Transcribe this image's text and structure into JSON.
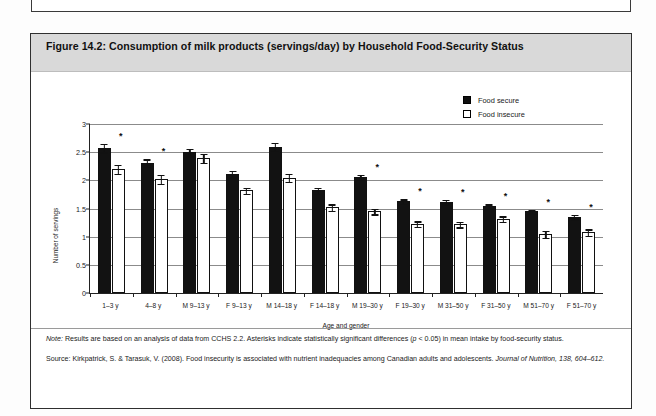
{
  "figure": {
    "title": "Figure 14.2: Consumption of milk products (servings/day) by Household Food-Security Status"
  },
  "legend": {
    "items": [
      {
        "label": "Food secure",
        "swatch": "filled-square-icon",
        "color": "#121212"
      },
      {
        "label": "Food insecure",
        "swatch": "open-square-icon",
        "color": "#ffffff"
      }
    ]
  },
  "notes": {
    "note_label": "Note:",
    "note_text": " Results are based on an analysis of data from CCHS 2.2. Asterisks indicate statistically significant differences (",
    "note_p_italic": "p",
    "note_text_2": " < 0.05) in mean intake by food-security status.",
    "source_label": "Source:",
    "source_text": " Kirkpatrick, S. & Tarasuk, V. (2008). Food insecurity is associated with nutrient inadequacies among Canadian adults and adolescents. ",
    "source_journal": "Journal of Nutrition, 138",
    "source_pages": ", 604–612."
  },
  "chart_data": {
    "type": "bar",
    "title": "Figure 14.2: Consumption of milk products (servings/day) by Household Food-Security Status",
    "xlabel": "Age and gender",
    "ylabel": "Number of servings",
    "ylim": [
      0,
      3
    ],
    "yticks": [
      0,
      0.5,
      1,
      1.5,
      2,
      2.5,
      3
    ],
    "ytick_labels": [
      "0",
      "0.5",
      "1",
      "1.5",
      "2",
      "2.5",
      "3"
    ],
    "grid": true,
    "legend_position": "top-right",
    "categories": [
      "1–3 y",
      "4–8 y",
      "M 9–13 y",
      "F 9–13 y",
      "M 14–18 y",
      "F 14–18 y",
      "M 19–30 y",
      "F 19–30 y",
      "M 31–50 y",
      "F 31–50 y",
      "M 51–70 y",
      "F 51–70 y"
    ],
    "series": [
      {
        "name": "Food secure",
        "color": "#121212",
        "values": [
          2.58,
          2.31,
          2.5,
          2.12,
          2.6,
          1.82,
          2.06,
          1.63,
          1.62,
          1.54,
          1.45,
          1.35
        ],
        "errors": [
          0.09,
          0.08,
          0.08,
          0.07,
          0.08,
          0.06,
          0.06,
          0.05,
          0.05,
          0.05,
          0.05,
          0.05
        ]
      },
      {
        "name": "Food insecure",
        "color": "#ffffff",
        "values": [
          2.2,
          2.02,
          2.4,
          1.82,
          2.05,
          1.52,
          1.45,
          1.23,
          1.22,
          1.32,
          1.05,
          1.08
        ],
        "errors": [
          0.09,
          0.09,
          0.09,
          0.07,
          0.08,
          0.07,
          0.06,
          0.06,
          0.06,
          0.06,
          0.07,
          0.07
        ]
      }
    ],
    "significance_markers": {
      "symbol": "*",
      "categories": [
        "1–3 y",
        "4–8 y",
        "M 19–30 y",
        "F 19–30 y",
        "M 31–50 y",
        "F 31–50 y",
        "M 51–70 y",
        "F 51–70 y"
      ]
    }
  }
}
